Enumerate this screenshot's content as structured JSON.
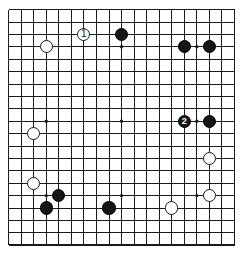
{
  "figure": {
    "board_size": 19,
    "visible_columns": 19,
    "visible_rows": 20,
    "colors": {
      "background": "#ffffff",
      "grid_line": "#1a1a1a",
      "black_stone": "#151515",
      "white_stone": "#ffffff",
      "stone_outline": "#1a1a1a",
      "star_point": "#1a1a1a"
    },
    "geometry": {
      "origin_x": 8.6,
      "origin_y": 9.6,
      "step_x": 12.55,
      "step_y": 12.4,
      "cols": 19,
      "rows": 20,
      "stone_radius": 6.6,
      "star_radius": 1.7,
      "border_width": 1.6,
      "line_width": 1.0
    },
    "star_points": [
      {
        "col": 3,
        "row": 3
      },
      {
        "col": 9,
        "row": 3
      },
      {
        "col": 15,
        "row": 3
      },
      {
        "col": 3,
        "row": 9
      },
      {
        "col": 9,
        "row": 9
      },
      {
        "col": 15,
        "row": 9
      },
      {
        "col": 3,
        "row": 15
      },
      {
        "col": 9,
        "row": 15
      },
      {
        "col": 15,
        "row": 15
      }
    ],
    "stones": [
      {
        "id": "w-move-1",
        "color": "white",
        "col": 6,
        "row": 2,
        "label": "1"
      },
      {
        "id": "b-d16",
        "color": "black",
        "col": 9,
        "row": 2,
        "label": ""
      },
      {
        "id": "w-c17",
        "color": "white",
        "col": 3,
        "row": 3,
        "label": ""
      },
      {
        "id": "b-q17a",
        "color": "black",
        "col": 14,
        "row": 3,
        "label": ""
      },
      {
        "id": "b-q17b",
        "color": "black",
        "col": 16,
        "row": 3,
        "label": ""
      },
      {
        "id": "w-c10",
        "color": "white",
        "col": 2,
        "row": 10,
        "label": ""
      },
      {
        "id": "b-move-2",
        "color": "black",
        "col": 14,
        "row": 9,
        "label": "2"
      },
      {
        "id": "b-r10",
        "color": "black",
        "col": 16,
        "row": 9,
        "label": ""
      },
      {
        "id": "w-r7",
        "color": "white",
        "col": 16,
        "row": 12,
        "label": ""
      },
      {
        "id": "w-c5",
        "color": "white",
        "col": 2,
        "row": 14,
        "label": ""
      },
      {
        "id": "b-e4",
        "color": "black",
        "col": 4,
        "row": 15,
        "label": ""
      },
      {
        "id": "b-d3",
        "color": "black",
        "col": 3,
        "row": 16,
        "label": ""
      },
      {
        "id": "b-j3",
        "color": "black",
        "col": 8,
        "row": 16,
        "label": ""
      },
      {
        "id": "w-n3",
        "color": "white",
        "col": 13,
        "row": 16,
        "label": ""
      },
      {
        "id": "w-r4",
        "color": "white",
        "col": 16,
        "row": 15,
        "label": ""
      }
    ],
    "move_markers": [
      {
        "number": "1",
        "color": "white",
        "col": 6,
        "row": 2
      },
      {
        "number": "2",
        "color": "black",
        "col": 14,
        "row": 9
      }
    ]
  }
}
